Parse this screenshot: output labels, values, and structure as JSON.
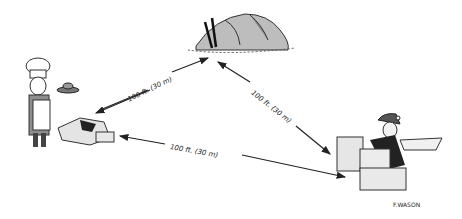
{
  "illustration": {
    "distance_labels": [
      {
        "id": "chef-to-tent",
        "text": "100 ft. (30 m)"
      },
      {
        "id": "tent-to-person",
        "text": "100 ft. (30 m)"
      },
      {
        "id": "fire-to-person",
        "text": "100 ft. (30 m)"
      }
    ],
    "signature": "F.WASON",
    "scene_elements": [
      "chef-with-plate",
      "cooking-fire-ring",
      "tent",
      "person-behind-rocks"
    ]
  }
}
